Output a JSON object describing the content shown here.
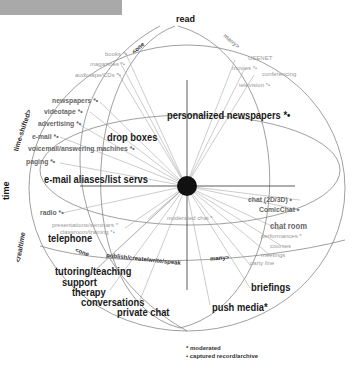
{
  "diagram": {
    "axes": {
      "top": "read",
      "left": "time",
      "left_upper": "time-shifted>",
      "left_lower": "<realtime",
      "one_top": "<one",
      "many_top": "many>",
      "one_bottom": "<one",
      "many_bottom": "many>",
      "publish": "publish/create/write/speak"
    },
    "labels": {
      "books": "books *•",
      "magazines": "magazines *•",
      "audiotape": "audiotape/CDs *•",
      "usenet": "USENET",
      "movies": "movies *•",
      "conferencing": "conferencing",
      "television": "television *•",
      "newspapers": "newspapers *•",
      "videotape": "videotape *•",
      "advertising": "advertising *•",
      "email": "e-mail *•",
      "voicemail": "voicemail/answering machines *•",
      "paging": "paging *•",
      "drop_boxes": "drop boxes",
      "personalized_newspapers": "personalized newspapers *•",
      "email_aliases": "e-mail aliases/list servs",
      "radio": "radio *•",
      "moderated_chat": "moderated chat *",
      "presentations": "presentations/seminars *",
      "classroom": "classroom/training *•",
      "telephone": "telephone",
      "chat_2d3d": "chat (2D/3D) •",
      "comicchat": "ComicChat •",
      "chat_room": "chat room",
      "performances": "performances *",
      "courses": "courses",
      "meetings": "meetings",
      "party_line": "party line",
      "tutoring": "tutoring/teaching",
      "support": "support",
      "therapy": "therapy",
      "conversations": "conversations",
      "private_chat": "private chat",
      "briefings": "briefings",
      "push_media": "push media*"
    },
    "legend": {
      "moderated": "* moderated",
      "captured": "• captured record/archive"
    }
  }
}
